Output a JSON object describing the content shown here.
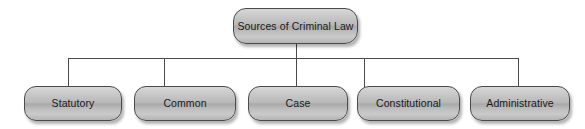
{
  "diagram": {
    "type": "hierarchy-tree",
    "orientation": "top-down",
    "line_color": "#4a4a4a",
    "box_border_color": "#4a4a4a",
    "box_fill_light": "#d8d8d8",
    "box_fill_dark": "#a9a9a9",
    "text_color": "#1a1a1a",
    "background_color": "#ffffff",
    "root": {
      "label": "Sources of Criminal Law"
    },
    "children": [
      {
        "label": "Statutory"
      },
      {
        "label": "Common"
      },
      {
        "label": "Case"
      },
      {
        "label": "Constitutional"
      },
      {
        "label": "Administrative"
      }
    ]
  }
}
